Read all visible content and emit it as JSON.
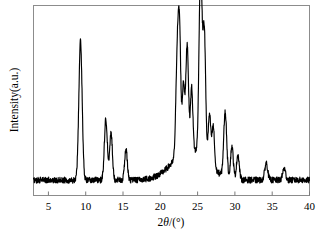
{
  "figure": {
    "type": "xrd-pattern",
    "background_color": "#ffffff",
    "line_color": "#000000",
    "frame_color": "#808080"
  },
  "axes": {
    "x_title_prefix": "2",
    "x_title_theta": "θ",
    "x_title_suffix": "/(°)",
    "x_title_full": "2θ/(°)",
    "y_title": "Intensity(a.u.)",
    "x_tick_labels": [
      "5",
      "10",
      "15",
      "20",
      "25",
      "30",
      "35",
      "40"
    ]
  },
  "chart_data": {
    "type": "line",
    "title": "",
    "subtitle": "",
    "xlabel": "2θ/(°)",
    "ylabel": "Intensity(a.u.)",
    "xlim": [
      3,
      40
    ],
    "ylim": [
      0,
      100
    ],
    "grid": false,
    "legend": null,
    "x_ticks": [
      5,
      10,
      15,
      20,
      25,
      30,
      35,
      40
    ],
    "y_ticks": [],
    "series": [
      {
        "name": "XRD intensity",
        "color": "#000000",
        "peaks": [
          {
            "x": 9.3,
            "height": 73,
            "width": 0.22
          },
          {
            "x": 12.7,
            "height": 32,
            "width": 0.2
          },
          {
            "x": 13.4,
            "height": 25,
            "width": 0.18
          },
          {
            "x": 15.4,
            "height": 16,
            "width": 0.18
          },
          {
            "x": 22.3,
            "height": 58,
            "width": 0.2
          },
          {
            "x": 22.6,
            "height": 52,
            "width": 0.16
          },
          {
            "x": 23.1,
            "height": 36,
            "width": 0.16
          },
          {
            "x": 23.6,
            "height": 56,
            "width": 0.18
          },
          {
            "x": 24.2,
            "height": 33,
            "width": 0.16
          },
          {
            "x": 25.4,
            "height": 100,
            "width": 0.2
          },
          {
            "x": 25.9,
            "height": 66,
            "width": 0.18
          },
          {
            "x": 26.6,
            "height": 26,
            "width": 0.18
          },
          {
            "x": 27.1,
            "height": 22,
            "width": 0.16
          },
          {
            "x": 28.7,
            "height": 34,
            "width": 0.2
          },
          {
            "x": 29.6,
            "height": 17,
            "width": 0.18
          },
          {
            "x": 30.4,
            "height": 13,
            "width": 0.18
          },
          {
            "x": 34.2,
            "height": 9,
            "width": 0.2
          },
          {
            "x": 36.6,
            "height": 6,
            "width": 0.2
          }
        ],
        "baseline": 6,
        "broad_hump": {
          "center": 24.0,
          "height": 16,
          "width": 3.2
        },
        "noise_amplitude": 1.6
      }
    ]
  }
}
